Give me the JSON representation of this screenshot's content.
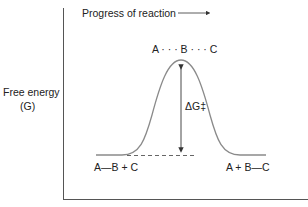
{
  "diagram": {
    "type": "reaction-energy-profile",
    "x_axis_label": "Progress of reaction",
    "y_axis_label_line1": "Free energy",
    "y_axis_label_line2": "(G)",
    "transition_state": "A · · · B · · · C",
    "reactants": "A—B + C",
    "products": "A + B—C",
    "activation_energy_label": "ΔG‡",
    "colors": {
      "curve": "#8a8a8a",
      "axis": "#555555",
      "text": "#222222"
    }
  }
}
